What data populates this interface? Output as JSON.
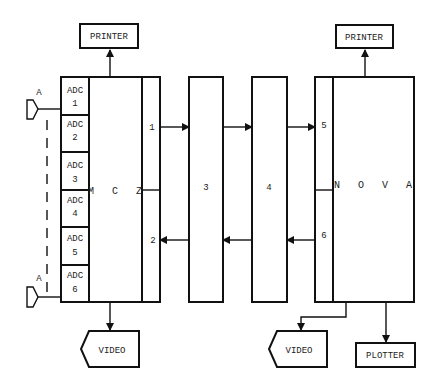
{
  "diagram": {
    "title": "",
    "nodes": {
      "printer_left": {
        "label": "PRINTER"
      },
      "printer_right": {
        "label": "PRINTER"
      },
      "mcz": {
        "label": "M C Z"
      },
      "nova": {
        "label": "N O V A"
      },
      "box3": {
        "label": "3"
      },
      "box4": {
        "label": "4"
      },
      "video_left": {
        "label": "VIDEO"
      },
      "video_right": {
        "label": "VIDEO"
      },
      "plotter": {
        "label": "PLOTTER"
      }
    },
    "adcs": [
      {
        "label": "ADC",
        "num": "1"
      },
      {
        "label": "ADC",
        "num": "2"
      },
      {
        "label": "ADC",
        "num": "3"
      },
      {
        "label": "ADC",
        "num": "4"
      },
      {
        "label": "ADC",
        "num": "5"
      },
      {
        "label": "ADC",
        "num": "6"
      }
    ],
    "ports": {
      "p1": "1",
      "p2": "2",
      "p5": "5",
      "p6": "6"
    },
    "inputs": [
      {
        "label": "A"
      },
      {
        "label": "A"
      }
    ],
    "edges": [
      {
        "from": "mcz",
        "to": "printer_left"
      },
      {
        "from": "mcz",
        "to": "video_left"
      },
      {
        "from": "port1",
        "to": "box3"
      },
      {
        "from": "box3",
        "to": "box4"
      },
      {
        "from": "box4",
        "to": "port5"
      },
      {
        "from": "port6",
        "to": "box4"
      },
      {
        "from": "box4",
        "to": "box3"
      },
      {
        "from": "box3",
        "to": "port2"
      },
      {
        "from": "nova",
        "to": "printer_right"
      },
      {
        "from": "nova",
        "to": "video_right"
      },
      {
        "from": "nova",
        "to": "plotter"
      }
    ]
  }
}
